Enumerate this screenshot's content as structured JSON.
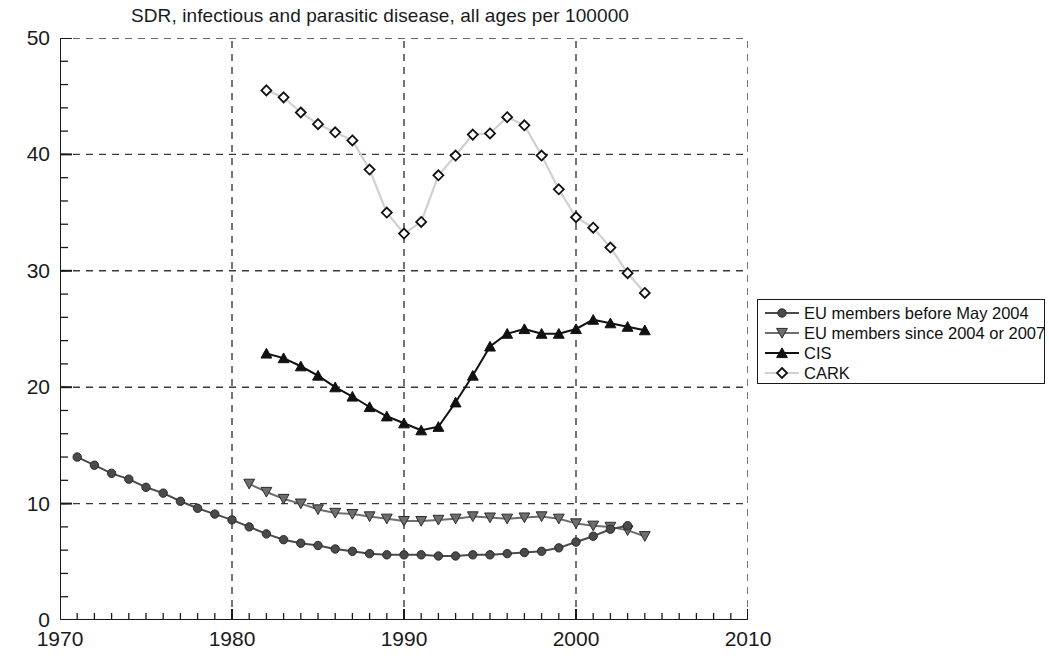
{
  "chart_data": {
    "type": "line",
    "title": "SDR, infectious and parasitic disease, all ages per 100000",
    "xlabel": "",
    "ylabel": "",
    "xlim": [
      1970,
      2010
    ],
    "ylim": [
      0,
      50
    ],
    "xticks": [
      1970,
      1980,
      1990,
      2000,
      2010
    ],
    "yticks": [
      0,
      10,
      20,
      30,
      40,
      50
    ],
    "x_minor_tick_step": 1,
    "y_minor_tick_step": 2,
    "grid": "dashed gridlines at major x and y ticks",
    "legend_position": "right, outside plot area",
    "series": [
      {
        "name": "EU members before May 2004",
        "marker": "circle-filled",
        "color": "#4a4a4a",
        "x": [
          1971,
          1972,
          1973,
          1974,
          1975,
          1976,
          1977,
          1978,
          1979,
          1980,
          1981,
          1982,
          1983,
          1984,
          1985,
          1986,
          1987,
          1988,
          1989,
          1990,
          1991,
          1992,
          1993,
          1994,
          1995,
          1996,
          1997,
          1998,
          1999,
          2000,
          2001,
          2002,
          2003
        ],
        "values": [
          14.0,
          13.3,
          12.6,
          12.1,
          11.4,
          10.9,
          10.2,
          9.6,
          9.1,
          8.6,
          8.0,
          7.4,
          6.9,
          6.6,
          6.4,
          6.1,
          5.9,
          5.7,
          5.6,
          5.6,
          5.6,
          5.5,
          5.5,
          5.6,
          5.6,
          5.7,
          5.8,
          5.9,
          6.2,
          6.7,
          7.2,
          7.8,
          8.1
        ]
      },
      {
        "name": "EU members since 2004 or 2007",
        "marker": "triangle-down-filled",
        "color": "#6e6e6e",
        "x": [
          1981,
          1982,
          1983,
          1984,
          1985,
          1986,
          1987,
          1988,
          1989,
          1990,
          1991,
          1992,
          1993,
          1994,
          1995,
          1996,
          1997,
          1998,
          1999,
          2000,
          2001,
          2002,
          2003,
          2004
        ],
        "values": [
          11.7,
          11.0,
          10.4,
          10.0,
          9.5,
          9.2,
          9.1,
          8.9,
          8.7,
          8.5,
          8.5,
          8.6,
          8.7,
          8.9,
          8.8,
          8.7,
          8.8,
          8.9,
          8.7,
          8.3,
          8.1,
          8.0,
          7.7,
          7.2
        ]
      },
      {
        "name": "CIS",
        "marker": "triangle-up-filled",
        "color": "#111111",
        "x": [
          1982,
          1983,
          1984,
          1985,
          1986,
          1987,
          1988,
          1989,
          1990,
          1991,
          1992,
          1993,
          1994,
          1995,
          1996,
          1997,
          1998,
          1999,
          2000,
          2001,
          2002,
          2003,
          2004
        ],
        "values": [
          22.9,
          22.5,
          21.8,
          21.0,
          20.0,
          19.2,
          18.3,
          17.5,
          16.9,
          16.3,
          16.6,
          18.7,
          21.0,
          23.5,
          24.6,
          25.0,
          24.6,
          24.6,
          25.0,
          25.8,
          25.5,
          25.2,
          24.9
        ]
      },
      {
        "name": "CARK",
        "marker": "diamond-open",
        "color": "#d0d0d0",
        "x": [
          1982,
          1983,
          1984,
          1985,
          1986,
          1987,
          1988,
          1989,
          1990,
          1991,
          1992,
          1993,
          1994,
          1995,
          1996,
          1997,
          1998,
          1999,
          2000,
          2001,
          2002,
          2003,
          2004
        ],
        "values": [
          45.5,
          44.9,
          43.6,
          42.6,
          41.9,
          41.2,
          38.7,
          35.0,
          33.2,
          34.2,
          38.2,
          39.9,
          41.7,
          41.8,
          43.2,
          42.5,
          39.9,
          37.0,
          34.6,
          33.7,
          32.0,
          29.8,
          28.1
        ]
      }
    ]
  },
  "legend": {
    "entries": [
      {
        "label": "EU members before May 2004"
      },
      {
        "label": "EU members since 2004 or 2007"
      },
      {
        "label": "CIS"
      },
      {
        "label": "CARK"
      }
    ]
  },
  "colors": {
    "axis": "#1a1a1a",
    "grid": "#3a3a3a",
    "background": "#ffffff"
  }
}
